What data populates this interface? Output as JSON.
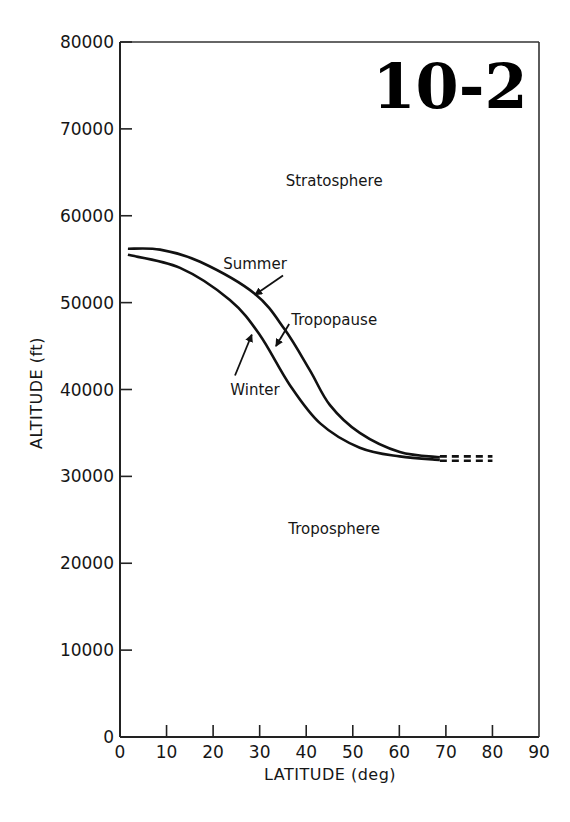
{
  "figure_label": "10-2",
  "chart_data": {
    "type": "line",
    "title": "",
    "xlabel": "LATITUDE (deg)",
    "ylabel": "ALTITUDE (ft)",
    "xlim": [
      0,
      90
    ],
    "ylim": [
      0,
      80000
    ],
    "xticks": [
      0,
      10,
      20,
      30,
      40,
      50,
      60,
      70,
      80,
      90
    ],
    "yticks": [
      0,
      10000,
      20000,
      30000,
      40000,
      50000,
      60000,
      70000,
      80000
    ],
    "grid": false,
    "legend": null,
    "series": [
      {
        "name": "Summer",
        "style": "solid",
        "x": [
          1.7,
          8.6,
          17.2,
          29.0,
          35.4,
          40.8,
          45.1,
          51.5,
          60.1,
          68.7
        ],
        "y": [
          56200,
          56100,
          54700,
          51000,
          46900,
          42200,
          38200,
          35000,
          32800,
          32200
        ]
      },
      {
        "name": "Summer (extrapolated)",
        "style": "dashed",
        "x": [
          68.7,
          80.0
        ],
        "y": [
          32300,
          32300
        ]
      },
      {
        "name": "Winter",
        "style": "solid",
        "x": [
          1.7,
          12.9,
          23.6,
          30.0,
          36.5,
          43.0,
          51.5,
          60.1,
          68.7
        ],
        "y": [
          55500,
          54000,
          50300,
          46300,
          40500,
          36100,
          33300,
          32300,
          31900
        ]
      },
      {
        "name": "Winter (extrapolated)",
        "style": "dashed",
        "x": [
          68.7,
          80.0
        ],
        "y": [
          31800,
          31800
        ]
      }
    ],
    "annotations": [
      {
        "text": "Stratosphere",
        "x": 46,
        "y": 64000
      },
      {
        "text": "Summer",
        "x": 29,
        "y": 54500,
        "arrow_to": [
          29.0,
          50900
        ]
      },
      {
        "text": "Tropopause",
        "x": 46,
        "y": 48000,
        "arrow_to": [
          33.5,
          45000
        ]
      },
      {
        "text": "Winter",
        "x": 29,
        "y": 40000,
        "arrow_to": [
          28.3,
          46300
        ]
      },
      {
        "text": "Troposphere",
        "x": 46,
        "y": 24000
      }
    ]
  }
}
